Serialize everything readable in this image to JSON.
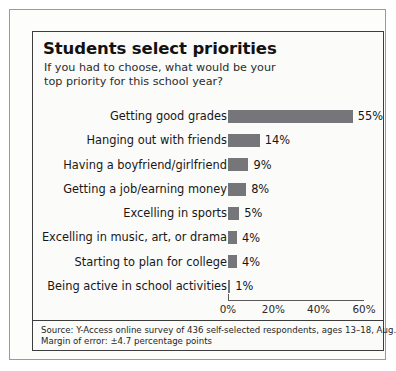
{
  "chart_data": {
    "type": "bar",
    "orientation": "horizontal",
    "title": "Students select priorities",
    "subtitle": "If you had to choose, what would be your top priority for this school year?",
    "categories": [
      "Getting good grades",
      "Hanging out with friends",
      "Having a boyfriend/girlfriend",
      "Getting a job/earning money",
      "Excelling in sports",
      "Excelling in music, art, or drama",
      "Starting to plan for college",
      "Being active in school activities"
    ],
    "values": [
      55,
      14,
      9,
      8,
      5,
      4,
      4,
      1
    ],
    "value_labels": [
      "55%",
      "14%",
      "9%",
      "8%",
      "5%",
      "4%",
      "4%",
      "1%"
    ],
    "xlabel": "",
    "ylabel": "",
    "xlim": [
      0,
      60
    ],
    "xticks": [
      0,
      20,
      40,
      60
    ],
    "xtick_labels": [
      "0%",
      "20%",
      "40%",
      "60%"
    ],
    "grid": false,
    "legend": "none",
    "bar_color": "#76767a"
  },
  "footer": {
    "source": "Source: Y-Access online survey of 436 self-selected respondents, ages 13–18, Aug. 2–12",
    "margin_of_error": "Margin of error: ±4.7 percentage points"
  }
}
